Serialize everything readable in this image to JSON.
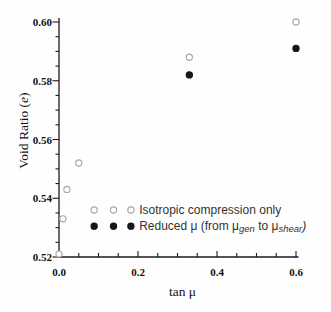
{
  "figure": {
    "background": "#fefefe"
  },
  "chart_data": {
    "type": "scatter",
    "title": "",
    "xlabel": "tan μ",
    "ylabel": "Void Ratio (e)",
    "ylabel_segments": [
      {
        "t": "Void Ratio ("
      },
      {
        "t": "e",
        "italic": true
      },
      {
        "t": ")"
      }
    ],
    "xlim": [
      0,
      0.6
    ],
    "ylim": [
      0.52,
      0.6
    ],
    "x_major_ticks": [
      0,
      0.2,
      0.4,
      0.6
    ],
    "x_tick_labels": [
      "0.0",
      "0.2",
      "0.4",
      "0.6"
    ],
    "x_minor_step": 0.05,
    "y_major_ticks": [
      0.52,
      0.54,
      0.56,
      0.58,
      0.6
    ],
    "y_tick_labels": [
      "0.52",
      "0.54",
      "0.56",
      "0.58",
      "0.60"
    ],
    "y_minor_step": 0.005,
    "grid": false,
    "axis_color": "#1a1a1a",
    "tick_label_color": "#111111",
    "legend_text_color": "#333333",
    "series": [
      {
        "name": "Isotropic compression only",
        "marker": "open-circle",
        "color": "#a8a8a8",
        "points": [
          [
            0,
            0.521
          ],
          [
            0.01,
            0.533
          ],
          [
            0.02,
            0.543
          ],
          [
            0.05,
            0.552
          ],
          [
            0.33,
            0.588
          ],
          [
            0.6,
            0.6
          ]
        ]
      },
      {
        "name": "Reduced μ (from μgen to μshear)",
        "marker": "filled-circle",
        "color": "#161616",
        "points": [
          [
            0.33,
            0.582
          ],
          [
            0.6,
            0.591
          ]
        ]
      }
    ],
    "legend": {
      "position": "inside-bottom-center",
      "markers_per_entry": 3,
      "marker_x_values": [
        0.089,
        0.138,
        0.182
      ],
      "text_x_value": 0.203,
      "entries": [
        {
          "label": "Isotropic compression only",
          "segments": [
            {
              "t": "Isotropic compression only"
            }
          ],
          "marker": "open-circle",
          "color": "#a8a8a8",
          "row_y_value": 0.536
        },
        {
          "label": "Reduced μ (from μgen to μshear)",
          "segments": [
            {
              "t": "Reduced μ (from μ"
            },
            {
              "t": "gen",
              "italic": true,
              "sub": true
            },
            {
              "t": " to μ"
            },
            {
              "t": "shear",
              "italic": true,
              "sub": true
            },
            {
              "t": ")",
              "italic": true
            }
          ],
          "marker": "filled-circle",
          "color": "#161616",
          "row_y_value": 0.5305
        }
      ]
    }
  }
}
